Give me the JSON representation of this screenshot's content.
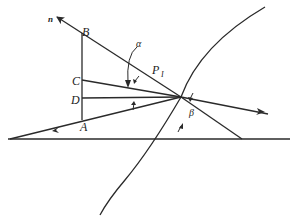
{
  "diagram": {
    "type": "ray-refraction-geometry",
    "labels": {
      "n": "n",
      "B": "B",
      "C": "C",
      "D": "D",
      "A": "A",
      "alpha": "α",
      "P": "P",
      "P_sub": "I",
      "beta": "β"
    },
    "colors": {
      "line": "#2a2a2a",
      "background": "#ffffff"
    }
  }
}
